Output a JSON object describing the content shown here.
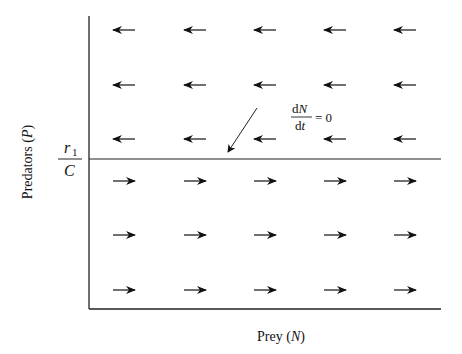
{
  "diagram": {
    "type": "phase-plane vector field (prey isocline)",
    "x_axis_label": "Prey (N)",
    "x_axis_label_parts": {
      "text": "Prey (",
      "var": "N",
      "close": ")"
    },
    "y_axis_label": "Predators (P)",
    "y_axis_label_parts": {
      "text": "Predators (",
      "var": "P",
      "close": ")"
    },
    "isocline": {
      "level_label": {
        "numerator": "r",
        "numerator_sub": "1",
        "denominator": "C"
      },
      "annotation": {
        "num": "dN",
        "num_var": "N",
        "den": "dt",
        "den_var": "t",
        "rhs": "= 0"
      },
      "description": "horizontal line P = r1/C"
    },
    "above_isocline": {
      "direction": "left",
      "rows": 3,
      "cols": 5
    },
    "below_isocline": {
      "direction": "right",
      "rows": 3,
      "cols": 5
    }
  }
}
